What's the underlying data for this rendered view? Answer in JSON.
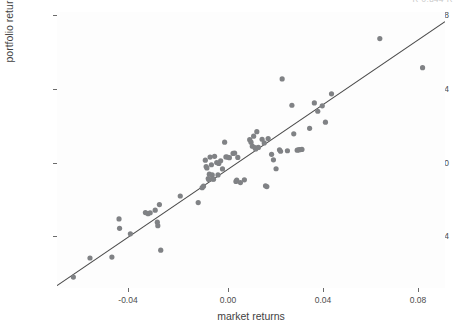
{
  "figure": {
    "background_color": "#ffffff",
    "panel_background_color": "#fdfdfd",
    "clipped_top_text": "R 0.844 R"
  },
  "style": {
    "point_color": "#808285",
    "point_radius": 2.6,
    "line_color": "#4a4a4a",
    "tick_color": "#6b6b6b",
    "text_color": "#4d4d4d"
  },
  "chart_data": {
    "type": "scatter",
    "title": "",
    "xlabel": "market returns",
    "ylabel": "portfolio returns",
    "xlim": [
      -0.0585,
      0.0885
    ],
    "ylim": [
      -0.062,
      0.0898
    ],
    "xticks": [
      -0.04,
      0.0,
      0.04,
      0.08
    ],
    "xtick_labels": [
      "-0.04",
      "0.00",
      "0.04",
      "0.08"
    ],
    "yticks": [
      -0.04,
      0.0,
      0.04,
      0.08
    ],
    "ytick_labels": [
      "-0.04",
      "0.00",
      "0.04",
      "0.08"
    ],
    "grid": false,
    "legend": "none",
    "series": [
      {
        "name": "observations",
        "marker": "circle",
        "color": "#808285",
        "points": [
          [
            -0.0523,
            -0.056
          ],
          [
            -0.046,
            -0.0455
          ],
          [
            -0.0377,
            -0.045
          ],
          [
            -0.035,
            -0.024
          ],
          [
            -0.0348,
            -0.0292
          ],
          [
            -0.0307,
            -0.0322
          ],
          [
            -0.025,
            -0.0205
          ],
          [
            -0.024,
            -0.0211
          ],
          [
            -0.0232,
            -0.0206
          ],
          [
            -0.0213,
            -0.0192
          ],
          [
            -0.0205,
            -0.0258
          ],
          [
            -0.0203,
            -0.0277
          ],
          [
            -0.0197,
            -0.0161
          ],
          [
            -0.0192,
            -0.0412
          ],
          [
            -0.0118,
            -0.0114
          ],
          [
            -0.005,
            -0.015
          ],
          [
            -0.0035,
            -0.0068
          ],
          [
            -0.003,
            -0.006
          ],
          [
            -0.0023,
            0.0083
          ],
          [
            -0.002,
            0.0048
          ],
          [
            -0.0017,
            0.004
          ],
          [
            -0.0012,
            -0.0018
          ],
          [
            -0.001,
            -0.0023
          ],
          [
            -0.0008,
            0.0006
          ],
          [
            -0.0005,
            0.01
          ],
          [
            0.0,
            0.0058
          ],
          [
            0.0003,
            0.0002
          ],
          [
            0.0005,
            -0.002
          ],
          [
            0.0008,
            -0.0022
          ],
          [
            0.0012,
            0.0104
          ],
          [
            0.002,
            0.007
          ],
          [
            0.0025,
            0.0002
          ],
          [
            0.0028,
            0.0065
          ],
          [
            0.0035,
            0.008
          ],
          [
            0.0042,
            0.0035
          ],
          [
            0.005,
            0.0182
          ],
          [
            0.0055,
            0.0101
          ],
          [
            0.006,
            0.01
          ],
          [
            0.0068,
            0.0097
          ],
          [
            0.0082,
            0.012
          ],
          [
            0.0088,
            0.0122
          ],
          [
            0.0093,
            -0.0034
          ],
          [
            0.0096,
            -0.0027
          ],
          [
            0.01,
            0.0098
          ],
          [
            0.011,
            -0.004
          ],
          [
            0.0125,
            -0.0025
          ],
          [
            0.0145,
            0.0196
          ],
          [
            0.015,
            0.0182
          ],
          [
            0.0155,
            0.016
          ],
          [
            0.016,
            0.0215
          ],
          [
            0.0165,
            0.0152
          ],
          [
            0.0168,
            0.0145
          ],
          [
            0.0172,
            0.024
          ],
          [
            0.0178,
            0.0153
          ],
          [
            0.0192,
            0.0198
          ],
          [
            0.02,
            0.0178
          ],
          [
            0.0205,
            -0.0058
          ],
          [
            0.021,
            -0.0062
          ],
          [
            0.0215,
            0.0202
          ],
          [
            0.0228,
            0.0115
          ],
          [
            0.0235,
            0.0085
          ],
          [
            0.0245,
            0.0036
          ],
          [
            0.0258,
            0.014
          ],
          [
            0.0262,
            0.0132
          ],
          [
            0.0268,
            0.053
          ],
          [
            0.0288,
            0.0135
          ],
          [
            0.0305,
            0.0385
          ],
          [
            0.0312,
            0.0228
          ],
          [
            0.0325,
            0.0138
          ],
          [
            0.033,
            0.014
          ],
          [
            0.0335,
            0.0141
          ],
          [
            0.0343,
            0.0142
          ],
          [
            0.0372,
            0.0258
          ],
          [
            0.039,
            0.0398
          ],
          [
            0.0403,
            0.0352
          ],
          [
            0.042,
            0.0382
          ],
          [
            0.0432,
            0.0292
          ],
          [
            0.0455,
            0.0448
          ],
          [
            0.0638,
            0.0752
          ],
          [
            0.08,
            0.0592
          ]
        ]
      }
    ],
    "fit_line": {
      "name": "regression line",
      "color": "#4a4a4a",
      "x": [
        -0.0585,
        0.0885
      ],
      "y": [
        -0.0607,
        0.0845
      ]
    }
  },
  "axis": {
    "x_title": "market returns",
    "y_title": "portfolio returns"
  }
}
